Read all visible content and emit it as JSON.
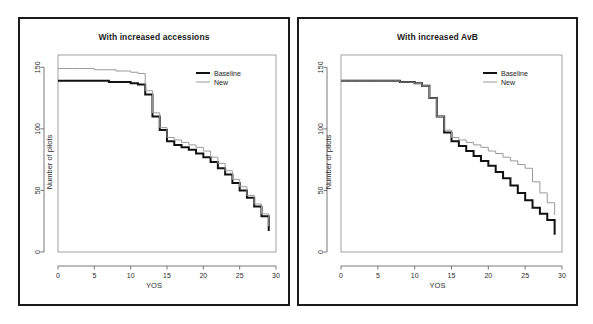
{
  "figure": {
    "background": "#ffffff",
    "frame_color": "#1a1a1a",
    "baseline_color": "#111111",
    "new_color": "#9a9a9a"
  },
  "chart_data": [
    {
      "type": "line",
      "id": "left",
      "title": "With increased accessions",
      "xlabel": "YOS",
      "ylabel": "Number of pilots",
      "xlim": [
        0,
        30
      ],
      "ylim": [
        0,
        160
      ],
      "xticks": [
        0,
        5,
        10,
        15,
        20,
        25,
        30
      ],
      "yticks": [
        0,
        50,
        100,
        150
      ],
      "grid": false,
      "legend_position": "top-right",
      "step_style": "hv",
      "series": [
        {
          "name": "Baseline",
          "color": "#111111",
          "width": 2.0,
          "x": [
            0,
            1,
            2,
            3,
            4,
            5,
            6,
            7,
            8,
            9,
            10,
            11,
            12,
            13,
            14,
            15,
            16,
            17,
            18,
            19,
            20,
            21,
            22,
            23,
            24,
            25,
            26,
            27,
            28,
            29
          ],
          "values": [
            139,
            139,
            139,
            139,
            139,
            139,
            139,
            138,
            138,
            138,
            137,
            136,
            128,
            110,
            99,
            90,
            87,
            85,
            83,
            80,
            77,
            73,
            68,
            63,
            56,
            50,
            44,
            37,
            29,
            21
          ]
        },
        {
          "name": "New",
          "color": "#9a9a9a",
          "width": 1.0,
          "x": [
            0,
            1,
            2,
            3,
            4,
            5,
            6,
            7,
            8,
            9,
            10,
            11,
            12,
            13,
            14,
            15,
            16,
            17,
            18,
            19,
            20,
            21,
            22,
            23,
            24,
            25,
            26,
            27,
            28,
            29
          ],
          "values": [
            149,
            149,
            149,
            149,
            149,
            148,
            148,
            148,
            147,
            147,
            146,
            145,
            131,
            113,
            101,
            93,
            91,
            89,
            87,
            85,
            82,
            77,
            72,
            66,
            59,
            53,
            46,
            39,
            31,
            25
          ]
        }
      ]
    },
    {
      "type": "line",
      "id": "right",
      "title": "With increased AvB",
      "xlabel": "YOS",
      "ylabel": "Number of pilots",
      "xlim": [
        0,
        30
      ],
      "ylim": [
        0,
        160
      ],
      "xticks": [
        0,
        5,
        10,
        15,
        20,
        25,
        30
      ],
      "yticks": [
        0,
        50,
        100,
        150
      ],
      "grid": false,
      "legend_position": "top-right",
      "step_style": "hv",
      "series": [
        {
          "name": "Baseline",
          "color": "#111111",
          "width": 2.0,
          "x": [
            0,
            1,
            2,
            3,
            4,
            5,
            6,
            7,
            8,
            9,
            10,
            11,
            12,
            13,
            14,
            15,
            16,
            17,
            18,
            19,
            20,
            21,
            22,
            23,
            24,
            25,
            26,
            27,
            28,
            29
          ],
          "values": [
            139,
            139,
            139,
            139,
            139,
            139,
            139,
            139,
            138,
            138,
            137,
            135,
            125,
            110,
            97,
            90,
            86,
            82,
            78,
            74,
            70,
            65,
            60,
            54,
            48,
            42,
            36,
            31,
            26,
            18
          ]
        },
        {
          "name": "New",
          "color": "#9a9a9a",
          "width": 1.0,
          "x": [
            0,
            1,
            2,
            3,
            4,
            5,
            6,
            7,
            8,
            9,
            10,
            11,
            12,
            13,
            14,
            15,
            16,
            17,
            18,
            19,
            20,
            21,
            22,
            23,
            24,
            25,
            26,
            27,
            28,
            29
          ],
          "values": [
            139,
            139,
            139,
            139,
            139,
            139,
            139,
            139,
            138,
            138,
            137,
            135,
            125,
            110,
            99,
            93,
            91,
            89,
            87,
            85,
            82,
            80,
            77,
            74,
            71,
            68,
            57,
            48,
            40,
            34
          ]
        }
      ]
    }
  ]
}
